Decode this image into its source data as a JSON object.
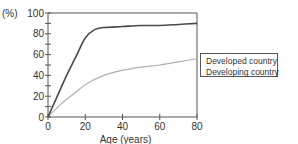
{
  "chart_data": {
    "type": "line",
    "title": "",
    "xlabel": "Age (years)",
    "ylabel": "(%)",
    "xlim": [
      0,
      80
    ],
    "ylim": [
      0,
      100
    ],
    "xticks": [
      0,
      20,
      40,
      60,
      80
    ],
    "yticks": [
      0,
      20,
      40,
      60,
      80,
      100
    ],
    "grid": false,
    "legend_position": "right",
    "x": [
      0,
      5,
      10,
      15,
      20,
      25,
      30,
      40,
      50,
      60,
      70,
      80
    ],
    "series": [
      {
        "name": "Developed country",
        "color": "#b0b0b0",
        "values": [
          0,
          9,
          17,
          24,
          31,
          36,
          40,
          45,
          48,
          50,
          53,
          56
        ]
      },
      {
        "name": "Developing country",
        "color": "#4a4a4a",
        "values": [
          0,
          20,
          40,
          58,
          76,
          84,
          86,
          87,
          88,
          88,
          89,
          90
        ]
      }
    ]
  },
  "labels": {
    "y_unit": "(%)",
    "x_axis_title": "Age (years)",
    "legend": [
      "Developed country",
      "Developing country"
    ]
  }
}
